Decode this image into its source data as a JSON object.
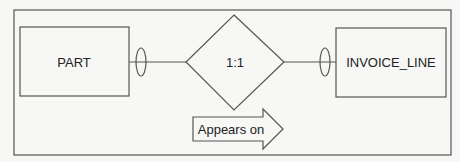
{
  "diagram": {
    "type": "entity-relationship",
    "colors": {
      "background": "#f7f7f5",
      "stroke": "#555555",
      "text": "#222222"
    },
    "entities": [
      {
        "id": "part",
        "label": "PART"
      },
      {
        "id": "invoice_line",
        "label": "INVOICE_LINE"
      }
    ],
    "relationship": {
      "label": "1:1",
      "shape": "diamond",
      "from": "part",
      "to": "invoice_line",
      "from_optionality": "optional",
      "to_optionality": "optional"
    },
    "direction_arrow": {
      "label": "Appears on",
      "direction": "right"
    }
  }
}
